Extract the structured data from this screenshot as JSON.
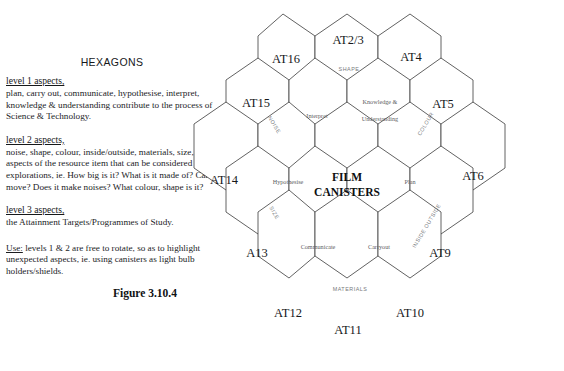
{
  "document": {
    "title": "HEXAGONS",
    "figure_caption": "Figure 3.10.4"
  },
  "levels": [
    {
      "heading": "level 1 aspects,",
      "body": "plan, carry out, communicate, hypothesise, interpret, knowledge & understanding contribute to the process of Science & Technology."
    },
    {
      "heading": "level 2 aspects,",
      "body": "noise, shape, colour, inside/outside, materials, size, aspects of the resource item that can be considered for explorations, ie. How big is it? What is it made of? Can it move? Does it make noises? What colour, shape is it?"
    },
    {
      "heading": "level 3 aspects,",
      "body": "the Attainment Targets/Programmes of Study."
    }
  ],
  "use_note": {
    "label": "Use:",
    "text": " levels 1 & 2 are free to rotate, so as to highlight unexpected aspects, ie. using canisters as light bulb holders/shields."
  },
  "diagram": {
    "center_label_line1": "FILM",
    "center_label_line2": "CANISTERS",
    "outer_hexes": [
      {
        "id": "at16",
        "label": "AT16"
      },
      {
        "id": "at2-3",
        "label": "AT2/3"
      },
      {
        "id": "at4",
        "label": "AT4"
      },
      {
        "id": "at15",
        "label": "AT15"
      },
      {
        "id": "at5",
        "label": "AT5"
      },
      {
        "id": "at14",
        "label": "AT14"
      },
      {
        "id": "at6",
        "label": "AT6"
      },
      {
        "id": "a13",
        "label": "A13"
      },
      {
        "id": "at9",
        "label": "AT9"
      },
      {
        "id": "at12",
        "label": "AT12"
      },
      {
        "id": "at11",
        "label": "AT11"
      },
      {
        "id": "at10",
        "label": "AT10"
      }
    ],
    "inner_hexes": [
      {
        "id": "interpret",
        "label": "Interpret"
      },
      {
        "id": "knowledge-understanding-line1",
        "label": "Knowledge &"
      },
      {
        "id": "knowledge-understanding-line2",
        "label": "Understanding"
      },
      {
        "id": "hypothesise",
        "label": "Hypothesise"
      },
      {
        "id": "plan",
        "label": "Plan"
      },
      {
        "id": "communicate",
        "label": "Communicate"
      },
      {
        "id": "carryout",
        "label": "Carryout"
      }
    ],
    "edge_labels": [
      {
        "id": "shape",
        "label": "SHAPE"
      },
      {
        "id": "noise",
        "label": "NOISE"
      },
      {
        "id": "colour",
        "label": "COLOUR"
      },
      {
        "id": "size",
        "label": "SIZE"
      },
      {
        "id": "inside-outside",
        "label": "INSIDE OUTSIDE"
      },
      {
        "id": "materials",
        "label": "MATERIALS"
      }
    ]
  },
  "colors": {
    "stroke": "#3a3a3a",
    "text": "#16181a",
    "muted": "#76797c",
    "background": "#ffffff"
  }
}
